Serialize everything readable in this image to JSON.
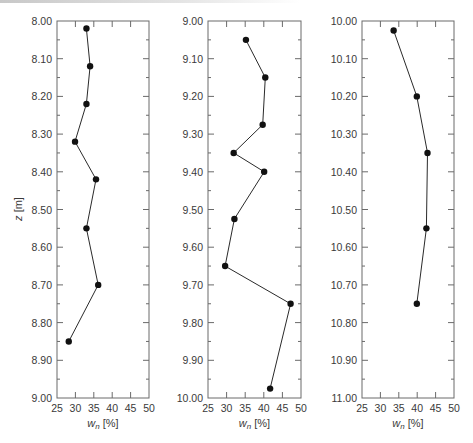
{
  "chart_data": [
    {
      "type": "line",
      "panel": 1,
      "title": "",
      "xlabel": "w_n [%]",
      "ylabel": "z [m]",
      "xlim": [
        25,
        50
      ],
      "ylim": [
        8.0,
        9.0
      ],
      "y_inverted": true,
      "x_ticks": [
        25,
        30,
        35,
        40,
        45,
        50
      ],
      "y_ticks": [
        "8.00",
        "8.10",
        "8.20",
        "8.30",
        "8.40",
        "8.50",
        "8.60",
        "8.70",
        "8.80",
        "8.90",
        "9.00"
      ],
      "grid": false,
      "markers": true,
      "points": [
        {
          "wn": 33.0,
          "z": 8.02
        },
        {
          "wn": 34.0,
          "z": 8.12
        },
        {
          "wn": 33.0,
          "z": 8.22
        },
        {
          "wn": 29.9,
          "z": 8.32
        },
        {
          "wn": 35.6,
          "z": 8.42
        },
        {
          "wn": 33.0,
          "z": 8.55
        },
        {
          "wn": 36.2,
          "z": 8.7
        },
        {
          "wn": 28.2,
          "z": 8.85
        }
      ]
    },
    {
      "type": "line",
      "panel": 2,
      "title": "",
      "xlabel": "w_n [%]",
      "ylabel": "",
      "xlim": [
        25,
        50
      ],
      "ylim": [
        9.0,
        10.0
      ],
      "y_inverted": true,
      "x_ticks": [
        25,
        30,
        35,
        40,
        45,
        50
      ],
      "y_ticks": [
        "9.00",
        "9.10",
        "9.20",
        "9.30",
        "9.40",
        "9.50",
        "9.60",
        "9.70",
        "9.80",
        "9.90",
        "10.00"
      ],
      "grid": false,
      "markers": true,
      "points": [
        {
          "wn": 35.2,
          "z": 9.05
        },
        {
          "wn": 40.4,
          "z": 9.15
        },
        {
          "wn": 39.7,
          "z": 9.275
        },
        {
          "wn": 31.9,
          "z": 9.35
        },
        {
          "wn": 40.1,
          "z": 9.4
        },
        {
          "wn": 32.1,
          "z": 9.525
        },
        {
          "wn": 29.6,
          "z": 9.65
        },
        {
          "wn": 47.2,
          "z": 9.75
        },
        {
          "wn": 41.7,
          "z": 9.975
        }
      ]
    },
    {
      "type": "line",
      "panel": 3,
      "title": "",
      "xlabel": "w_n [%]",
      "ylabel": "",
      "xlim": [
        25,
        50
      ],
      "ylim": [
        10.0,
        11.0
      ],
      "y_inverted": true,
      "x_ticks": [
        25,
        30,
        35,
        40,
        45,
        50
      ],
      "y_ticks": [
        "10.00",
        "10.10",
        "10.20",
        "10.30",
        "10.40",
        "10.50",
        "10.60",
        "10.70",
        "10.80",
        "10.90",
        "11.00"
      ],
      "grid": false,
      "markers": true,
      "points": [
        {
          "wn": 33.6,
          "z": 10.025
        },
        {
          "wn": 39.9,
          "z": 10.2
        },
        {
          "wn": 42.8,
          "z": 10.35
        },
        {
          "wn": 42.5,
          "z": 10.55
        },
        {
          "wn": 39.9,
          "z": 10.75
        }
      ]
    }
  ],
  "labels": {
    "ylabel_italic": "z",
    "ylabel_unit": " [m]",
    "xlabel_italic": "w",
    "xlabel_sub": "n",
    "xlabel_unit": " [%]"
  },
  "colors": {
    "line": "#2a2a2a",
    "marker": "#111111",
    "axis": "#6a6a6a",
    "text": "#3a3a3a"
  }
}
